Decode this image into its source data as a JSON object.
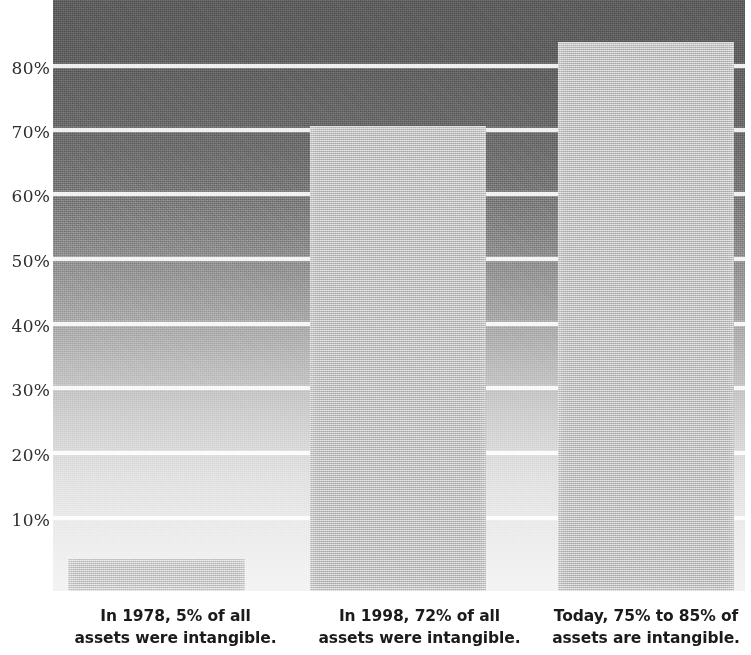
{
  "chart_data": {
    "type": "bar",
    "title": "",
    "subtitle": "",
    "xlabel": "",
    "ylabel": "",
    "ylim": [
      0,
      90
    ],
    "grid": true,
    "legend": "none",
    "categories": [
      "In 1978",
      "In 1998",
      "Today"
    ],
    "values": [
      5,
      72,
      85
    ],
    "value_labels": [
      "5%",
      "72%",
      "85%"
    ],
    "y_ticks": [
      10,
      20,
      30,
      40,
      50,
      60,
      70,
      80
    ],
    "y_tick_labels": [
      "10%",
      "20%",
      "30%",
      "40%",
      "50%",
      "60%",
      "70%",
      "80%"
    ],
    "series": [
      {
        "name": "Share of assets that are intangible",
        "values": [
          5,
          72,
          85
        ]
      }
    ],
    "annotations": [
      "In 1978, 5% of all assets were intangible.",
      "In 1998, 72% of all assets were intangible.",
      "Today, 75% to 85% of assets are intangible."
    ]
  },
  "axis": {
    "y_tick_labels": [
      "80%",
      "70%",
      "60%",
      "50%",
      "40%",
      "30%",
      "20%",
      "10%"
    ]
  },
  "captions": [
    {
      "line1": "In 1978, 5% of all",
      "line2": "assets were intangible."
    },
    {
      "line1": "In 1998, 72% of all",
      "line2": "assets were intangible."
    },
    {
      "line1": "Today, 75% to 85% of",
      "line2": "assets are intangible."
    }
  ],
  "colors": {
    "background_top": "#5d5d5d",
    "background_bottom": "#f3f3f3",
    "bar_fill": "#cfcfcf",
    "bar_fill_light": "#d9d9d9",
    "gridline": "#ffffff",
    "text": "#1b1b1b",
    "axis_text": "#2f2f2f"
  }
}
